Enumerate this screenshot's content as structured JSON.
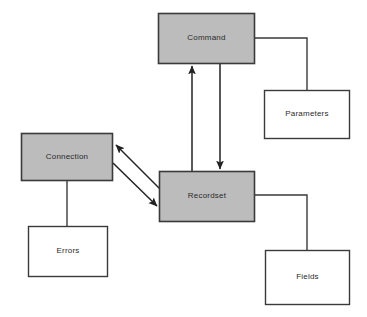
{
  "diagram": {
    "type": "object-model-block-diagram",
    "background_color": "#ffffff",
    "shaded_fill": "#bcbcbc",
    "plain_fill": "#ffffff",
    "stroke_color": "#3a3a3a",
    "text_color": "#2b2b2b",
    "nodes": [
      {
        "id": "command",
        "label": "Command",
        "style": "shaded",
        "x": 158,
        "y": 13,
        "w": 97,
        "h": 51
      },
      {
        "id": "parameters",
        "label": "Parameters",
        "style": "plain",
        "x": 264,
        "y": 90,
        "w": 86,
        "h": 49
      },
      {
        "id": "connection",
        "label": "Connection",
        "style": "shaded",
        "x": 21,
        "y": 133,
        "w": 92,
        "h": 48
      },
      {
        "id": "recordset",
        "label": "Recordset",
        "style": "shaded",
        "x": 159,
        "y": 171,
        "w": 96,
        "h": 51
      },
      {
        "id": "errors",
        "label": "Errors",
        "style": "plain",
        "x": 28,
        "y": 226,
        "w": 80,
        "h": 51
      },
      {
        "id": "fields",
        "label": "Fields",
        "style": "plain",
        "x": 265,
        "y": 250,
        "w": 85,
        "h": 55
      }
    ],
    "connectors": [
      {
        "id": "recordset-to-command",
        "from": "recordset",
        "to": "command",
        "kind": "arrow",
        "arrowhead": "end"
      },
      {
        "id": "command-to-recordset",
        "from": "command",
        "to": "recordset",
        "kind": "arrow",
        "arrowhead": "end"
      },
      {
        "id": "recordset-to-connection",
        "from": "recordset",
        "to": "connection",
        "kind": "arrow",
        "arrowhead": "end"
      },
      {
        "id": "connection-to-recordset",
        "from": "connection",
        "to": "recordset",
        "kind": "arrow",
        "arrowhead": "end"
      },
      {
        "id": "command-to-parameters",
        "from": "command",
        "to": "parameters",
        "kind": "elbow",
        "arrowhead": "none"
      },
      {
        "id": "recordset-to-fields",
        "from": "recordset",
        "to": "fields",
        "kind": "elbow",
        "arrowhead": "none"
      },
      {
        "id": "connection-to-errors",
        "from": "connection",
        "to": "errors",
        "kind": "line",
        "arrowhead": "none"
      }
    ]
  }
}
